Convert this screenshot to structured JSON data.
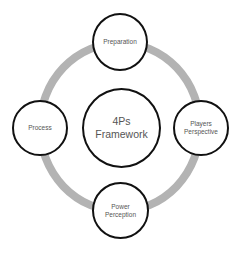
{
  "diagram": {
    "center": {
      "label_line1": "4Ps",
      "label_line2": "Framework"
    },
    "nodes": {
      "top": {
        "label_line1": "Preparation",
        "label_line2": ""
      },
      "right": {
        "label_line1": "Players",
        "label_line2": "Perspective"
      },
      "bottom": {
        "label_line1": "Power",
        "label_line2": "Perception"
      },
      "left": {
        "label_line1": "Process",
        "label_line2": ""
      }
    },
    "colors": {
      "ring": "#b3b3b3",
      "circle_border": "#111111",
      "text": "#555555"
    }
  }
}
